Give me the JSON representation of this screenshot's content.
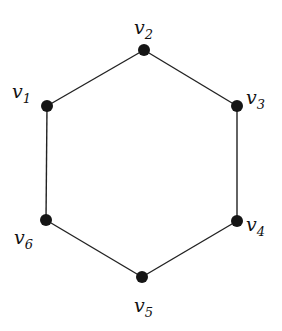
{
  "diagram": {
    "type": "cycle-graph",
    "name": "C6 hexagon",
    "colors": {
      "node": "#151515",
      "edge": "#222222",
      "background": "#ffffff"
    },
    "nodes": [
      {
        "id": "v1",
        "base": "v",
        "sub": "1",
        "x": 47,
        "y": 106,
        "label_x": 12,
        "label_y": 82
      },
      {
        "id": "v2",
        "base": "v",
        "sub": "2",
        "x": 144,
        "y": 50,
        "label_x": 134,
        "label_y": 18
      },
      {
        "id": "v3",
        "base": "v",
        "sub": "3",
        "x": 237,
        "y": 106,
        "label_x": 246,
        "label_y": 88
      },
      {
        "id": "v4",
        "base": "v",
        "sub": "4",
        "x": 237,
        "y": 221,
        "label_x": 246,
        "label_y": 215
      },
      {
        "id": "v5",
        "base": "v",
        "sub": "5",
        "x": 142,
        "y": 277,
        "label_x": 134,
        "label_y": 296
      },
      {
        "id": "v6",
        "base": "v",
        "sub": "6",
        "x": 46,
        "y": 220,
        "label_x": 14,
        "label_y": 228
      }
    ],
    "edges": [
      [
        "v1",
        "v2"
      ],
      [
        "v2",
        "v3"
      ],
      [
        "v3",
        "v4"
      ],
      [
        "v4",
        "v5"
      ],
      [
        "v5",
        "v6"
      ],
      [
        "v6",
        "v1"
      ]
    ]
  }
}
